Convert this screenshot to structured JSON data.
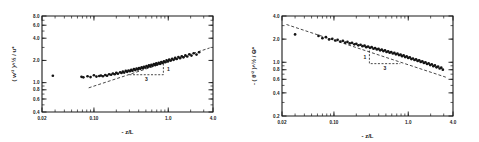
{
  "figure": {
    "caption": "",
    "background": "#ffffff",
    "ink": "#1a1a1a"
  },
  "chart_data": [
    {
      "type": "scatter",
      "id": "left-panel",
      "title": "",
      "xlabel": "- z/L",
      "ylabel": "( w'² )^½ / u*",
      "xscale": "log",
      "yscale": "log",
      "xlim": [
        0.02,
        4.0
      ],
      "ylim": [
        0.4,
        8.0
      ],
      "grid": false,
      "legend": "none",
      "xticks": [
        0.02,
        0.1,
        1.0,
        4.0
      ],
      "xticklabels": [
        "0.02",
        "0.10",
        "1.0",
        "4.0"
      ],
      "yticks": [
        0.4,
        0.6,
        0.8,
        1.0,
        2.0,
        4.0,
        6.0,
        8.0
      ],
      "yticklabels": [
        "0.4",
        "0.6",
        "0.8",
        "1.0",
        "2.0",
        "4.0",
        "6.0",
        "8.0"
      ],
      "annotations": [
        {
          "text": "1",
          "role": "slope-rise"
        },
        {
          "text": "3",
          "role": "slope-run"
        }
      ],
      "fit": {
        "type": "power-law",
        "slope": 0.3333,
        "label": "1/3 slope reference",
        "x": [
          0.085,
          3.6
        ],
        "y": [
          0.85,
          2.95
        ],
        "style": "dashed"
      },
      "points": [
        [
          0.028,
          1.24
        ],
        [
          0.068,
          1.2
        ],
        [
          0.072,
          1.18
        ],
        [
          0.082,
          1.22
        ],
        [
          0.09,
          1.19
        ],
        [
          0.1,
          1.26
        ],
        [
          0.108,
          1.21
        ],
        [
          0.118,
          1.23
        ],
        [
          0.124,
          1.25
        ],
        [
          0.132,
          1.22
        ],
        [
          0.142,
          1.27
        ],
        [
          0.15,
          1.24
        ],
        [
          0.16,
          1.3
        ],
        [
          0.17,
          1.28
        ],
        [
          0.18,
          1.33
        ],
        [
          0.19,
          1.3
        ],
        [
          0.2,
          1.36
        ],
        [
          0.21,
          1.32
        ],
        [
          0.225,
          1.38
        ],
        [
          0.235,
          1.35
        ],
        [
          0.245,
          1.41
        ],
        [
          0.255,
          1.37
        ],
        [
          0.268,
          1.44
        ],
        [
          0.28,
          1.4
        ],
        [
          0.292,
          1.46
        ],
        [
          0.305,
          1.43
        ],
        [
          0.318,
          1.49
        ],
        [
          0.33,
          1.45
        ],
        [
          0.345,
          1.52
        ],
        [
          0.36,
          1.48
        ],
        [
          0.375,
          1.55
        ],
        [
          0.39,
          1.51
        ],
        [
          0.405,
          1.58
        ],
        [
          0.42,
          1.54
        ],
        [
          0.438,
          1.61
        ],
        [
          0.455,
          1.57
        ],
        [
          0.472,
          1.64
        ],
        [
          0.49,
          1.6
        ],
        [
          0.51,
          1.68
        ],
        [
          0.53,
          1.63
        ],
        [
          0.55,
          1.71
        ],
        [
          0.57,
          1.66
        ],
        [
          0.592,
          1.74
        ],
        [
          0.615,
          1.7
        ],
        [
          0.64,
          1.78
        ],
        [
          0.665,
          1.73
        ],
        [
          0.69,
          1.82
        ],
        [
          0.715,
          1.77
        ],
        [
          0.745,
          1.86
        ],
        [
          0.775,
          1.8
        ],
        [
          0.805,
          1.9
        ],
        [
          0.84,
          1.85
        ],
        [
          0.875,
          1.95
        ],
        [
          0.91,
          1.89
        ],
        [
          0.95,
          2.0
        ],
        [
          0.99,
          1.94
        ],
        [
          1.03,
          2.05
        ],
        [
          1.08,
          1.99
        ],
        [
          1.13,
          2.1
        ],
        [
          1.18,
          2.04
        ],
        [
          1.24,
          2.16
        ],
        [
          1.3,
          2.09
        ],
        [
          1.37,
          2.22
        ],
        [
          1.44,
          2.14
        ],
        [
          1.52,
          2.28
        ],
        [
          1.6,
          2.2
        ],
        [
          1.7,
          2.34
        ],
        [
          1.8,
          2.26
        ],
        [
          1.92,
          2.42
        ],
        [
          2.05,
          2.33
        ],
        [
          2.2,
          2.5
        ],
        [
          2.4,
          2.4
        ],
        [
          2.6,
          2.58
        ]
      ]
    },
    {
      "type": "scatter",
      "id": "right-panel",
      "title": "",
      "xlabel": "- z/L",
      "ylabel": "- ( θ'² )^½ / Θ*",
      "xscale": "log",
      "yscale": "log",
      "xlim": [
        0.02,
        4.0
      ],
      "ylim": [
        0.2,
        4.0
      ],
      "grid": false,
      "legend": "none",
      "xticks": [
        0.02,
        0.1,
        1.0,
        4.0
      ],
      "xticklabels": [
        "0.02",
        "0.10",
        "1.0",
        "4.0"
      ],
      "yticks": [
        0.2,
        0.4,
        0.6,
        0.8,
        1.0,
        2.0,
        4.0
      ],
      "yticklabels": [
        "0.2",
        "0.4",
        "0.6",
        "0.8",
        "1.0",
        "2.0",
        "4.0"
      ],
      "annotations": [
        {
          "text": "1",
          "role": "slope-rise"
        },
        {
          "text": "3",
          "role": "slope-run"
        }
      ],
      "fit": {
        "type": "power-law",
        "slope": -0.3333,
        "label": "-1/3 slope reference",
        "x": [
          0.023,
          3.2
        ],
        "y": [
          3.1,
          0.64
        ],
        "style": "dashed"
      },
      "points": [
        [
          0.03,
          2.3
        ],
        [
          0.062,
          2.2
        ],
        [
          0.07,
          2.06
        ],
        [
          0.078,
          2.12
        ],
        [
          0.086,
          1.98
        ],
        [
          0.095,
          2.02
        ],
        [
          0.104,
          1.92
        ],
        [
          0.112,
          1.96
        ],
        [
          0.122,
          1.86
        ],
        [
          0.132,
          1.9
        ],
        [
          0.142,
          1.8
        ],
        [
          0.152,
          1.84
        ],
        [
          0.163,
          1.76
        ],
        [
          0.175,
          1.79
        ],
        [
          0.188,
          1.71
        ],
        [
          0.2,
          1.74
        ],
        [
          0.213,
          1.66
        ],
        [
          0.228,
          1.69
        ],
        [
          0.242,
          1.62
        ],
        [
          0.258,
          1.65
        ],
        [
          0.272,
          1.57
        ],
        [
          0.288,
          1.6
        ],
        [
          0.305,
          1.54
        ],
        [
          0.322,
          1.57
        ],
        [
          0.34,
          1.5
        ],
        [
          0.358,
          1.53
        ],
        [
          0.378,
          1.47
        ],
        [
          0.398,
          1.5
        ],
        [
          0.418,
          1.43
        ],
        [
          0.44,
          1.46
        ],
        [
          0.462,
          1.4
        ],
        [
          0.486,
          1.43
        ],
        [
          0.51,
          1.36
        ],
        [
          0.536,
          1.39
        ],
        [
          0.562,
          1.33
        ],
        [
          0.59,
          1.36
        ],
        [
          0.62,
          1.3
        ],
        [
          0.65,
          1.33
        ],
        [
          0.682,
          1.27
        ],
        [
          0.715,
          1.3
        ],
        [
          0.75,
          1.24
        ],
        [
          0.788,
          1.26
        ],
        [
          0.825,
          1.2
        ],
        [
          0.866,
          1.23
        ],
        [
          0.908,
          1.17
        ],
        [
          0.952,
          1.19
        ],
        [
          0.998,
          1.14
        ],
        [
          1.048,
          1.16
        ],
        [
          1.1,
          1.1
        ],
        [
          1.155,
          1.12
        ],
        [
          1.212,
          1.07
        ],
        [
          1.272,
          1.09
        ],
        [
          1.336,
          1.04
        ],
        [
          1.402,
          1.06
        ],
        [
          1.472,
          1.01
        ],
        [
          1.546,
          1.03
        ],
        [
          1.622,
          0.98
        ],
        [
          1.704,
          1.0
        ],
        [
          1.79,
          0.95
        ],
        [
          1.88,
          0.97
        ],
        [
          1.974,
          0.92
        ],
        [
          2.072,
          0.94
        ],
        [
          2.176,
          0.89
        ],
        [
          2.286,
          0.91
        ],
        [
          2.4,
          0.86
        ],
        [
          2.52,
          0.88
        ],
        [
          2.646,
          0.83
        ],
        [
          2.78,
          0.85
        ],
        [
          2.92,
          0.8
        ]
      ]
    }
  ]
}
